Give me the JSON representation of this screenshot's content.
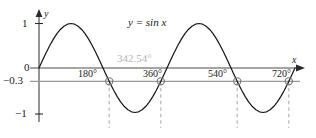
{
  "figure": {
    "equation_label": "y = sin x",
    "annotation_label": "342.54°",
    "y_axis_name": "y",
    "x_axis_name": "x",
    "y_ticks": [
      {
        "label": "1",
        "value": 1
      },
      {
        "label": "0",
        "value": 0
      },
      {
        "label": "−0.3",
        "value": -0.3
      },
      {
        "label": "−1",
        "value": -1
      }
    ],
    "x_ticks": [
      {
        "label": "180°",
        "value": 180
      },
      {
        "label": "360°",
        "value": 360
      },
      {
        "label": "540°",
        "value": 540
      },
      {
        "label": "720°",
        "value": 720
      }
    ],
    "colors": {
      "curve": "#1a1a1a",
      "axis": "#4d4d4d",
      "threshold_line": "#999999",
      "dashed_drop": "#b0b0b0",
      "marker": "#7a7a7a",
      "annotation_text": "#b4b4b4",
      "background": "#ffffff"
    }
  },
  "chart_data": {
    "type": "line",
    "title": "",
    "xlabel": "x",
    "ylabel": "y",
    "xlim": [
      -20,
      760
    ],
    "ylim": [
      -1.12,
      1.12
    ],
    "grid": false,
    "legend": "none",
    "series": [
      {
        "name": "y = sin x",
        "style": "solid",
        "color": "#1a1a1a",
        "x": [
          0,
          10,
          20,
          30,
          40,
          50,
          60,
          70,
          80,
          90,
          100,
          110,
          120,
          130,
          140,
          150,
          160,
          170,
          180,
          190,
          200,
          210,
          220,
          230,
          240,
          250,
          260,
          270,
          280,
          290,
          300,
          310,
          320,
          330,
          340,
          350,
          360,
          370,
          380,
          390,
          400,
          410,
          420,
          430,
          440,
          450,
          460,
          470,
          480,
          490,
          500,
          510,
          520,
          530,
          540,
          550,
          560,
          570,
          580,
          590,
          600,
          610,
          620,
          630,
          640,
          650,
          660,
          670,
          680,
          690,
          700,
          710,
          720
        ],
        "y": [
          0,
          0.174,
          0.342,
          0.5,
          0.643,
          0.766,
          0.866,
          0.94,
          0.985,
          1,
          0.985,
          0.94,
          0.866,
          0.766,
          0.643,
          0.5,
          0.342,
          0.174,
          0,
          -0.174,
          -0.342,
          -0.5,
          -0.643,
          -0.766,
          -0.866,
          -0.94,
          -0.985,
          -1,
          -0.985,
          -0.94,
          -0.866,
          -0.766,
          -0.643,
          -0.5,
          -0.342,
          -0.174,
          0,
          0.174,
          0.342,
          0.5,
          0.643,
          0.766,
          0.866,
          0.94,
          0.985,
          1,
          0.985,
          0.94,
          0.866,
          0.766,
          0.643,
          0.5,
          0.342,
          0.174,
          0,
          -0.174,
          -0.342,
          -0.5,
          -0.643,
          -0.766,
          -0.866,
          -0.94,
          -0.985,
          -1,
          -0.985,
          -0.94,
          -0.866,
          -0.766,
          -0.643,
          -0.5,
          -0.342,
          -0.174,
          0
        ]
      },
      {
        "name": "y = -0.3",
        "style": "solid-gray",
        "color": "#999999",
        "x": [
          0,
          720
        ],
        "y": [
          -0.3,
          -0.3
        ]
      }
    ],
    "intersections": [
      {
        "x": 197.46,
        "y": -0.3
      },
      {
        "x": 342.54,
        "y": -0.3
      },
      {
        "x": 557.46,
        "y": -0.3
      },
      {
        "x": 702.54,
        "y": -0.3
      }
    ],
    "annotations": [
      {
        "text": "y = sin x",
        "x": 330,
        "y": 0.78
      },
      {
        "text": "342.54°",
        "x": 342.54,
        "y": 0.17
      }
    ]
  }
}
